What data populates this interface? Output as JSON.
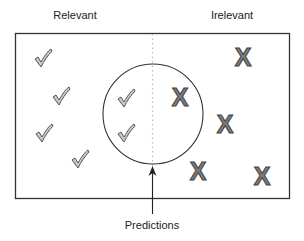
{
  "labels": {
    "relevant": "Relevant",
    "irrelevant": "Irelevant",
    "predictions": "Predictions"
  },
  "colors": {
    "frame": "#333333",
    "divider": "#bbbbbb",
    "check_fill": "#c8c8c8",
    "check_stroke": "#555555",
    "x_fill": "#7a7a7a",
    "x_stroke": "#444444"
  },
  "items": {
    "checks_outside": [
      {
        "name": "check-1"
      },
      {
        "name": "check-2"
      },
      {
        "name": "check-3"
      },
      {
        "name": "check-4"
      }
    ],
    "checks_inside": [
      {
        "name": "check-5"
      },
      {
        "name": "check-6"
      }
    ],
    "x_inside": [
      {
        "name": "x-1"
      }
    ],
    "x_outside": [
      {
        "name": "x-2"
      },
      {
        "name": "x-3"
      },
      {
        "name": "x-4"
      },
      {
        "name": "x-5"
      }
    ]
  }
}
